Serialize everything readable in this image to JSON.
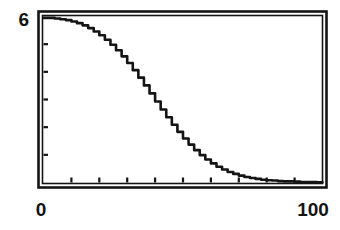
{
  "figure": {
    "name": "decay-curve-figure",
    "background_color": "#ffffff",
    "ink_color": "#141414"
  },
  "axis_labels": {
    "y_max": "6",
    "x_min": "0",
    "x_max": "100"
  },
  "chart_data": {
    "type": "line",
    "title": "",
    "subtitle": "",
    "xlabel": "",
    "ylabel": "",
    "xlim": [
      0,
      100
    ],
    "ylim": [
      0,
      6
    ],
    "grid": false,
    "legend": false,
    "legend_position": "none",
    "x_ticks": [
      0,
      10,
      20,
      30,
      40,
      50,
      60,
      70,
      80,
      90,
      100
    ],
    "x_tick_labels": [
      "0",
      "",
      "",
      "",
      "",
      "",
      "",
      "",
      "",
      "",
      "100"
    ],
    "y_ticks": [
      0,
      1,
      2,
      3,
      4,
      5,
      6
    ],
    "y_tick_labels": [
      "",
      "",
      "",
      "",
      "",
      "",
      "6"
    ],
    "series": [
      {
        "name": "decay",
        "x": [
          0,
          2,
          4,
          6,
          8,
          10,
          12,
          14,
          16,
          18,
          20,
          22,
          24,
          26,
          28,
          30,
          32,
          34,
          36,
          38,
          40,
          42,
          44,
          46,
          48,
          50,
          52,
          54,
          56,
          58,
          60,
          62,
          64,
          66,
          68,
          70,
          72,
          74,
          76,
          78,
          80,
          82,
          84,
          86,
          88,
          90,
          92,
          94,
          96,
          98,
          100
        ],
        "values": [
          5.95,
          5.95,
          5.93,
          5.9,
          5.87,
          5.82,
          5.76,
          5.68,
          5.58,
          5.46,
          5.32,
          5.16,
          4.98,
          4.78,
          4.56,
          4.32,
          4.06,
          3.79,
          3.51,
          3.22,
          2.93,
          2.64,
          2.36,
          2.09,
          1.83,
          1.59,
          1.37,
          1.17,
          0.99,
          0.83,
          0.69,
          0.57,
          0.47,
          0.38,
          0.31,
          0.25,
          0.2,
          0.16,
          0.13,
          0.1,
          0.08,
          0.07,
          0.05,
          0.04,
          0.04,
          0.03,
          0.02,
          0.02,
          0.02,
          0.01,
          0.01
        ]
      }
    ]
  }
}
